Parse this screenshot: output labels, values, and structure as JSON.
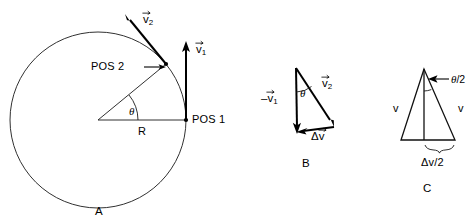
{
  "figure": {
    "background_color": "#ffffff",
    "line_color": "#000000",
    "panels": [
      {
        "id": "A",
        "label": "A",
        "description": "Circle of radius R with velocity vectors at POS 1 and POS 2 separated by angle theta",
        "labels": {
          "pos1": "POS 1",
          "pos2": "POS 2",
          "radius": "R",
          "angle": "θ",
          "v1_base": "v",
          "v1_sub": "1",
          "v2_base": "v",
          "v2_sub": "2"
        }
      },
      {
        "id": "B",
        "label": "B",
        "description": "Vector triangle: minus v1 plus v2 gives delta v, with included angle theta",
        "labels": {
          "minus_v1_prefix": "–",
          "minus_v1_base": "v",
          "minus_v1_sub": "1",
          "v2_base": "v",
          "v2_sub": "2",
          "delta_v_prefix": "Δ",
          "delta_v_base": "v",
          "angle": "θ"
        }
      },
      {
        "id": "C",
        "label": "C",
        "description": "Isosceles triangle of equal sides v split by median, half angle theta/2 subtends base delta v over 2",
        "labels": {
          "v_left": "v",
          "v_right": "v",
          "half_angle": "θ/2",
          "half_angle_numerator": "θ",
          "half_angle_denominator": "/2",
          "base": "Δv/2"
        }
      }
    ]
  }
}
